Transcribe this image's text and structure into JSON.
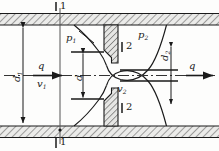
{
  "figure": {
    "name": "orifice-plate-flow-diagram",
    "type": "engineering-cross-section",
    "colors": {
      "line": "#1a1a1a",
      "hatch": "#555555",
      "wall_fill": "#e8e8e6",
      "plate_fill": "#e2e2e0",
      "background": "#fdfdfc",
      "centerline": "#333333"
    }
  },
  "labels": {
    "section_1_top": "1",
    "section_1_bottom": "1",
    "section_2_top": "2",
    "section_2_bottom": "2",
    "pressure_upstream": "p",
    "pressure_upstream_sub": "1",
    "pressure_downstream": "p",
    "pressure_downstream_sub": "2",
    "flow_left": "q",
    "flow_right": "q",
    "velocity_upstream": "v",
    "velocity_upstream_sub": "1",
    "velocity_downstream": "v",
    "velocity_downstream_sub": "2",
    "diameter_pipe": "d",
    "diameter_pipe_sub": "1",
    "diameter_orifice": "d",
    "diameter_vena": "d",
    "diameter_vena_sub": "2"
  },
  "geometry": {
    "pipe_top_wall_y": 13,
    "pipe_bottom_wall_y": 138,
    "pipe_inner_top_y": 25,
    "pipe_inner_bottom_y": 126,
    "centerline_y": 75,
    "plate_x": 104,
    "plate_width": 14,
    "orifice_half_height": 12,
    "section1_x": 60,
    "section2_x": 111,
    "width": 219,
    "height": 151
  }
}
